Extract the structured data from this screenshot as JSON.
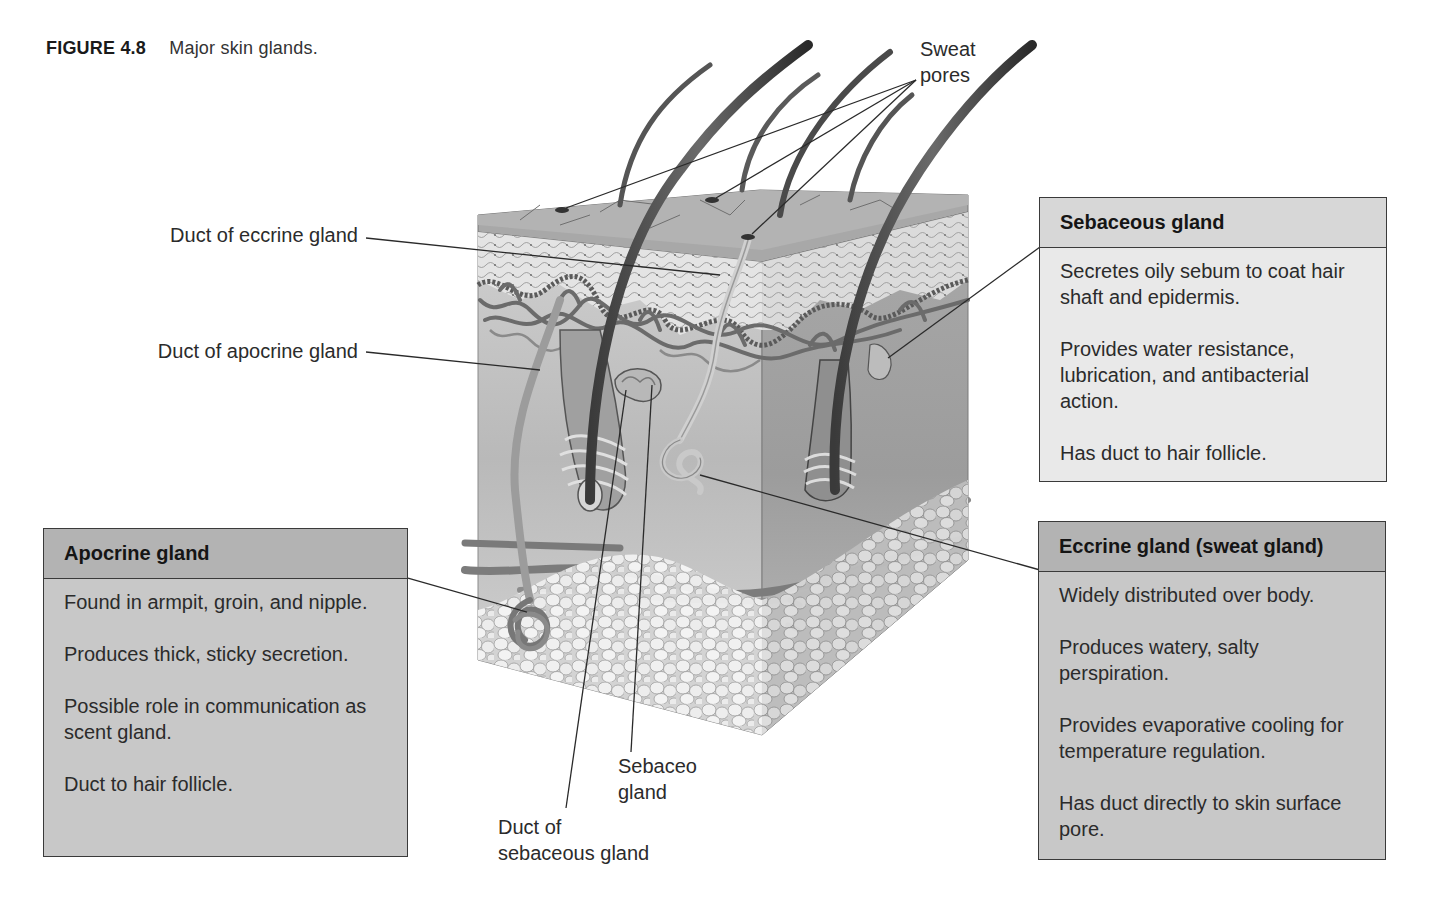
{
  "figure": {
    "number": "FIGURE 4.8",
    "title": "Major skin glands."
  },
  "callouts": {
    "sweat_pores": [
      "Sweat",
      "pores"
    ],
    "duct_eccrine": "Duct of eccrine gland",
    "duct_apocrine": "Duct of apocrine gland",
    "sebaceous_gland_label": [
      "Sebaceo",
      "gland"
    ],
    "duct_sebaceous": [
      "Duct of",
      "sebaceous gland"
    ]
  },
  "boxes": {
    "sebaceous": {
      "title": "Sebaceous gland",
      "points": [
        "Secretes oily sebum to coat hair shaft and epidermis.",
        "Provides water resistance, lubrication, and antibacterial action.",
        "Has duct to hair follicle."
      ]
    },
    "eccrine": {
      "title": "Eccrine gland (sweat gland)",
      "points": [
        "Widely distributed over body.",
        "Produces watery, salty perspiration.",
        "Provides evaporative cooling for temperature regulation.",
        "Has duct directly to skin surface pore."
      ]
    },
    "apocrine": {
      "title": "Apocrine gland",
      "points": [
        "Found in armpit, groin, and nipple.",
        "Produces thick, sticky secretion.",
        "Possible role in communication as scent gland.",
        "Duct to hair follicle."
      ]
    }
  },
  "colors": {
    "box_light_bg": "#e9e9e9",
    "box_light_head": "#d7d7d7",
    "box_mid_bg": "#c8c8c8",
    "box_mid_head": "#b3b3b3",
    "border": "#3a3a3a"
  }
}
